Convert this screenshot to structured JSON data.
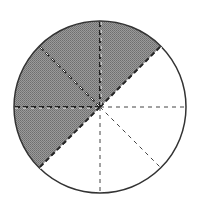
{
  "figure": {
    "total_parts": 8,
    "shaded_parts": 4,
    "shaded_start_angle_deg": 45,
    "shaded_end_angle_deg": 225,
    "colors": {
      "shade": "#8c8c8c",
      "outline": "#333333",
      "divider": "#444444",
      "background": "#ffffff"
    }
  },
  "chart_data": {
    "type": "pie",
    "title": "",
    "categories": [
      "shaded",
      "unshaded"
    ],
    "values": [
      4,
      4
    ],
    "sectors": 8,
    "fraction_shaded": "4/8"
  }
}
